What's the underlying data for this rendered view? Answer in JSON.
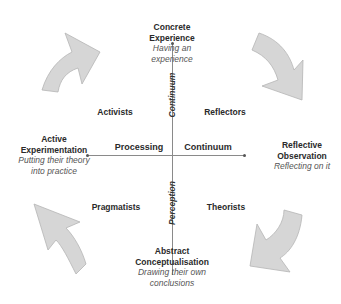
{
  "diagram": {
    "quadrants": {
      "top": {
        "title_line1": "Concrete",
        "title_line2": "Experience",
        "desc_line1": "Having an",
        "desc_line2": "experience"
      },
      "right": {
        "title_line1": "Reflective",
        "title_line2": "Observation",
        "desc_line1": "Reflecting on it"
      },
      "bottom": {
        "title_line1": "Abstract",
        "title_line2": "Conceptualisation",
        "desc_line1": "Drawing their own",
        "desc_line2": "conclusions"
      },
      "left": {
        "title_line1": "Active",
        "title_line2": "Experimentation",
        "desc_line1": "Putting their theory",
        "desc_line2": "into practice"
      }
    },
    "styles": {
      "top_left": "Activists",
      "top_right": "Reflectors",
      "bottom_left": "Pragmatists",
      "bottom_right": "Theorists"
    },
    "axes": {
      "horizontal_left": "Processing",
      "horizontal_right": "Continuum",
      "vertical_top": "Continuum",
      "vertical_bottom": "Perception"
    },
    "colors": {
      "arrow_fill": "#d6d6d6",
      "arrow_stroke": "#b5b5b5",
      "axis": "#8a8a8a"
    }
  }
}
